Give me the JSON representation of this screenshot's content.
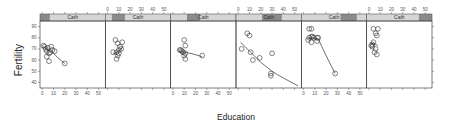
{
  "chart_data": {
    "type": "scatter",
    "title": "",
    "xlabel": "Education",
    "ylabel": "Fertility",
    "xlim": [
      -2,
      56
    ],
    "ylim": [
      35,
      95
    ],
    "x_ticks": [
      0,
      10,
      20,
      30,
      40,
      50
    ],
    "y_ticks": [
      40,
      50,
      60,
      70,
      80,
      90
    ],
    "conditioning_variable": "Cath",
    "smoother": "loess",
    "grid": false,
    "legend": "none",
    "panels": [
      {
        "strip_label": "Cath",
        "shingle_range": [
          0,
          0.15
        ],
        "points": [
          [
            1,
            73
          ],
          [
            2,
            72
          ],
          [
            3,
            70
          ],
          [
            4,
            68
          ],
          [
            5,
            71
          ],
          [
            6,
            66
          ],
          [
            7,
            67
          ],
          [
            8,
            72
          ],
          [
            9,
            69
          ],
          [
            4,
            63
          ],
          [
            6,
            59
          ],
          [
            11,
            68
          ],
          [
            20,
            57
          ]
        ],
        "smooth": [
          [
            1,
            72
          ],
          [
            5,
            69
          ],
          [
            10,
            66
          ],
          [
            15,
            61
          ],
          [
            20,
            57
          ]
        ]
      },
      {
        "strip_label": "Cath",
        "shingle_range": [
          0.1,
          0.3
        ],
        "points": [
          [
            7,
            78
          ],
          [
            9,
            75
          ],
          [
            13,
            76
          ],
          [
            11,
            72
          ],
          [
            10,
            69
          ],
          [
            12,
            70
          ],
          [
            5,
            67
          ],
          [
            8,
            67
          ],
          [
            10,
            66
          ],
          [
            9,
            64
          ],
          [
            8,
            61
          ]
        ],
        "smooth": [
          [
            5,
            66
          ],
          [
            8,
            67
          ],
          [
            11,
            69
          ],
          [
            14,
            72
          ]
        ]
      },
      {
        "strip_label": "Cath",
        "shingle_range": [
          0.25,
          0.45
        ],
        "points": [
          [
            10,
            78
          ],
          [
            11,
            73
          ],
          [
            7,
            69
          ],
          [
            8,
            68
          ],
          [
            9,
            67
          ],
          [
            11,
            66
          ],
          [
            10,
            64
          ],
          [
            11,
            61
          ],
          [
            26,
            64
          ],
          [
            6,
            69
          ]
        ],
        "smooth": [
          [
            6,
            68
          ],
          [
            10,
            67
          ],
          [
            16,
            66
          ],
          [
            26,
            63
          ]
        ]
      },
      {
        "strip_label": "Cath",
        "shingle_range": [
          0.4,
          0.7
        ],
        "points": [
          [
            8,
            84
          ],
          [
            10,
            82
          ],
          [
            3,
            70
          ],
          [
            11,
            67
          ],
          [
            13,
            60
          ],
          [
            19,
            62
          ],
          [
            30,
            66
          ],
          [
            29,
            48
          ],
          [
            29,
            46
          ]
        ],
        "smooth": [
          [
            2,
            76
          ],
          [
            10,
            68
          ],
          [
            20,
            58
          ],
          [
            30,
            50
          ],
          [
            40,
            44
          ],
          [
            53,
            37
          ]
        ]
      },
      {
        "strip_label": "Cath",
        "shingle_range": [
          0.6,
          0.85
        ],
        "points": [
          [
            5,
            88
          ],
          [
            7,
            88
          ],
          [
            5,
            80
          ],
          [
            7,
            81
          ],
          [
            8,
            81
          ],
          [
            9,
            80
          ],
          [
            12,
            80
          ],
          [
            13,
            80
          ],
          [
            4,
            78
          ],
          [
            7,
            76
          ],
          [
            12,
            77
          ],
          [
            28,
            48
          ]
        ],
        "smooth": [
          [
            4,
            79
          ],
          [
            8,
            80
          ],
          [
            13,
            79
          ],
          [
            20,
            64
          ],
          [
            28,
            48
          ]
        ]
      },
      {
        "strip_label": "Cath",
        "shingle_range": [
          0.8,
          1.0
        ],
        "points": [
          [
            4,
            88
          ],
          [
            8,
            88
          ],
          [
            6,
            84
          ],
          [
            7,
            82
          ],
          [
            4,
            76
          ],
          [
            3,
            74
          ],
          [
            2,
            73
          ],
          [
            3,
            72
          ],
          [
            6,
            70
          ],
          [
            5,
            67
          ],
          [
            7,
            65
          ]
        ],
        "smooth": [
          [
            2,
            74
          ],
          [
            4,
            75
          ],
          [
            6,
            74
          ],
          [
            8,
            73
          ]
        ]
      }
    ]
  },
  "labels": {
    "xlabel": "Education",
    "ylabel": "Fertility"
  }
}
